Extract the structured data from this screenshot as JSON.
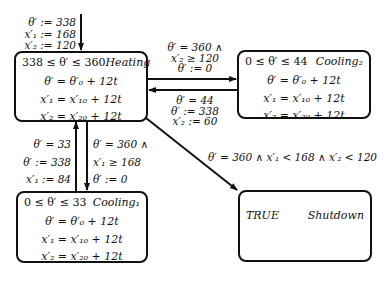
{
  "states": {
    "heating": {
      "invariant": "338 ≤ θ′ ≤ 360",
      "name": "Heating",
      "flows": [
        "θ′ = θ′₀ + 12t",
        "x′₁ = x′₁₀ + 12t",
        "x′₂ = x′₂₀ + 12t"
      ]
    },
    "cooling2": {
      "invariant": "0 ≤ θ′ ≤ 44",
      "name": "Cooling₂",
      "flows": [
        "θ′ = θ′₀ + 12t",
        "x′₁ = x′₁₀ + 12t",
        "x′₂ = x′₂₀ + 12t"
      ]
    },
    "cooling1": {
      "invariant": "0 ≤ θ′ ≤ 33",
      "name": "Cooling₁",
      "flows": [
        "θ′ = θ′₀ + 12t",
        "x′₁ = x′₁₀ + 12t",
        "x′₂ = x′₂₀ + 12t"
      ]
    },
    "shutdown": {
      "invariant": "TRUE",
      "name": "Shutdown"
    }
  },
  "transitions": {
    "initial": [
      "θ′ := 338",
      "x′₁ := 168",
      "x′₂ := 120"
    ],
    "heating_to_cooling2": [
      "θ′ = 360 ∧",
      "x′₂ ≥ 120",
      "θ′ := 0"
    ],
    "cooling2_to_heating": [
      "θ′ = 44",
      "θ′ := 338",
      "x′₂ := 60"
    ],
    "cooling1_to_heating": [
      "θ′ = 33",
      "θ′ := 338",
      "x′₁ := 84"
    ],
    "heating_to_cooling1": [
      "θ′ = 360 ∧",
      "x′₁ ≥ 168",
      "θ′ := 0"
    ],
    "heating_to_shutdown": "θ′ = 360 ∧ x′₁ < 168 ∧ x′₂ < 120"
  }
}
